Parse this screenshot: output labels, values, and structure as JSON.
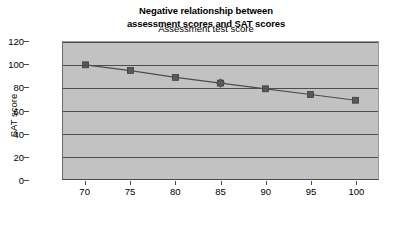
{
  "chart_data": {
    "type": "line",
    "title": "Negative relationship between assessment scores and SAT scores",
    "title_lines": [
      "Negative relationship between",
      "assessment scores and SAT scores"
    ],
    "xlabel": "Assessment test score",
    "ylabel": "SAT score",
    "x": [
      70,
      75,
      80,
      85,
      90,
      95,
      100
    ],
    "series": [
      {
        "name": "SAT score",
        "values": [
          100,
          95,
          89,
          84,
          79,
          74,
          69
        ],
        "marker": "square",
        "color": "#595959",
        "line_color": "#4d4d4d"
      },
      {
        "name": "overlap-point",
        "x": [
          85
        ],
        "values": [
          84
        ],
        "marker": "diamond",
        "color": "#595959"
      }
    ],
    "xlim": [
      67.5,
      102.5
    ],
    "ylim": [
      0,
      120
    ],
    "xticks": [
      "70",
      "75",
      "80",
      "85",
      "90",
      "95",
      "100"
    ],
    "yticks": [
      "0",
      "20",
      "40",
      "60",
      "80",
      "100",
      "120"
    ],
    "grid": "horizontal",
    "legend": "none",
    "plot_background": "#c2c2c2",
    "figure_background": "#ffffff"
  }
}
